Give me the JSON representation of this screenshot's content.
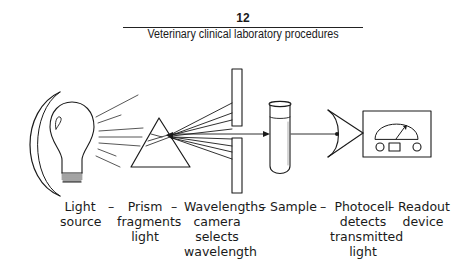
{
  "header": {
    "page_number": "12",
    "running_title": "Veterinary clinical laboratory procedures"
  },
  "figure": {
    "type": "spectrophotometer-schematic",
    "components": [
      {
        "id": "light-source",
        "icon": "light-bulb-icon",
        "lines": [
          "Light",
          "source"
        ]
      },
      {
        "id": "prism",
        "icon": "prism-icon",
        "lines": [
          "Prism",
          "fragments",
          "light"
        ]
      },
      {
        "id": "wavelength-selector",
        "icon": "slit-icon",
        "lines": [
          "Wavelengths",
          "camera",
          "selects",
          "wavelength"
        ]
      },
      {
        "id": "sample",
        "icon": "test-tube-icon",
        "lines": [
          "Sample"
        ]
      },
      {
        "id": "photocell",
        "icon": "photocell-icon",
        "lines": [
          "Photocell",
          "detects",
          "transmitted",
          "light"
        ]
      },
      {
        "id": "readout",
        "icon": "meter-icon",
        "lines": [
          "Readout",
          "device"
        ]
      }
    ],
    "separator": "–"
  }
}
